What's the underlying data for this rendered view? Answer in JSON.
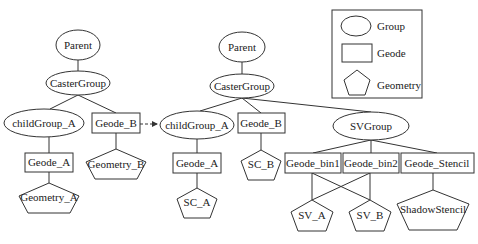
{
  "colors": {
    "stroke": "#333333",
    "text": "#222222",
    "background": "#ffffff"
  },
  "legend": {
    "items": [
      {
        "shape": "ellipse",
        "label": "Group"
      },
      {
        "shape": "rectangle",
        "label": "Geode"
      },
      {
        "shape": "pentagon",
        "label": "Geometry"
      }
    ]
  },
  "left_tree": {
    "parent": "Parent",
    "caster_group": "CasterGroup",
    "child_group": "childGroup_A",
    "geode_b": "Geode_B",
    "geode_a": "Geode_A",
    "geometry_b": "Geometry_B",
    "geometry_a": "Geometry_A"
  },
  "right_tree": {
    "parent": "Parent",
    "caster_group": "CasterGroup",
    "child_group": "childGroup_A",
    "geode_b": "Geode_B",
    "sv_group": "SVGroup",
    "geode_a": "Geode_A",
    "sc_b": "SC_B",
    "sc_a": "SC_A",
    "geode_bin1": "Geode_bin1",
    "geode_bin2": "Geode_bin2",
    "geode_stencil": "Geode_Stencil",
    "sv_a": "SV_A",
    "sv_b": "SV_B",
    "shadow_stencil": "ShadowStencil"
  }
}
